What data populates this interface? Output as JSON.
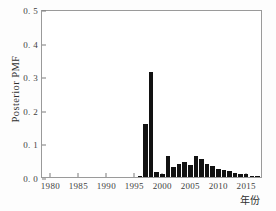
{
  "chart_data": {
    "type": "bar",
    "title": "",
    "xlabel": "年份",
    "ylabel": "Posterior PMF",
    "xlim": [
      1978.5,
      2018.0
    ],
    "ylim": [
      0.0,
      0.5
    ],
    "grid": false,
    "legend": null,
    "bar_color": "#121212",
    "frame_color": "#9a9a9a",
    "background": "#ffffff",
    "x_ticks": [
      1980,
      1985,
      1990,
      1995,
      2000,
      2005,
      2010,
      2015
    ],
    "x_tick_labels": [
      "1980",
      "1985",
      "1990",
      "1995",
      "2000",
      "2005",
      "2010",
      "2015"
    ],
    "y_ticks": [
      0.0,
      0.1,
      0.2,
      0.3,
      0.4,
      0.5
    ],
    "y_tick_labels": [
      "0. 0",
      "0. 1",
      "0. 2",
      "0. 3",
      "0. 4",
      "0. 5"
    ],
    "categories": [
      1996,
      1997,
      1998,
      1999,
      2000,
      2001,
      2002,
      2003,
      2004,
      2005,
      2006,
      2007,
      2008,
      2009,
      2010,
      2011,
      2012,
      2013,
      2014,
      2015,
      2016,
      2017
    ],
    "values": [
      0.004,
      0.158,
      0.313,
      0.016,
      0.01,
      0.063,
      0.031,
      0.039,
      0.045,
      0.036,
      0.064,
      0.053,
      0.039,
      0.034,
      0.024,
      0.021,
      0.019,
      0.012,
      0.008,
      0.01,
      0.004,
      0.003
    ]
  },
  "axes": {
    "y_title": "Posterior PMF",
    "x_title": "年份"
  },
  "caption": {
    "text": ""
  }
}
